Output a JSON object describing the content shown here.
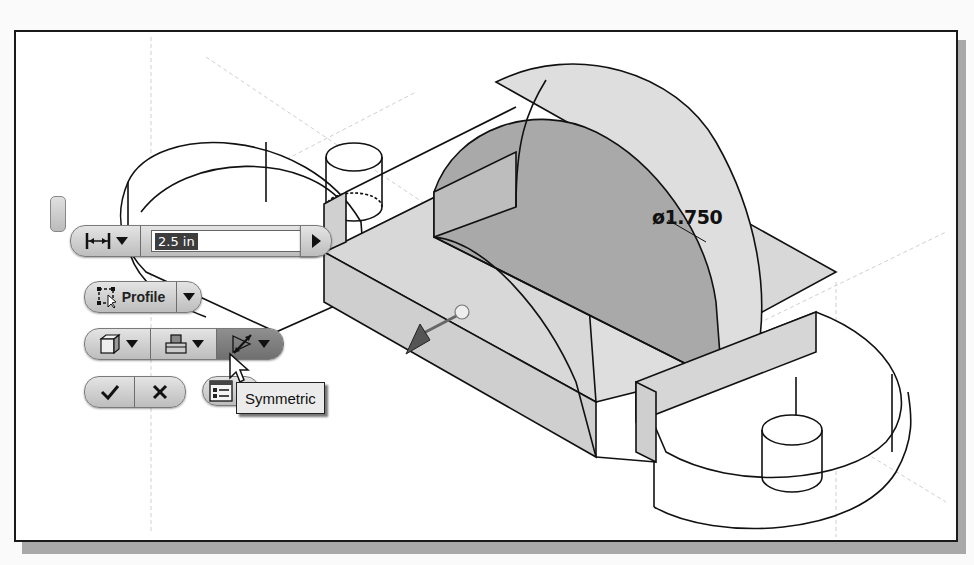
{
  "canvas": {
    "frame_color": "#1a1a1a",
    "shadow_color": "#a9a9a9",
    "model_fill_light": "#d6d6d6",
    "model_fill_dark": "#a7a7a7"
  },
  "model": {
    "dimension_label": "ø1.750",
    "icons": [
      "extrude-direction-arrow-icon",
      "drag-handle-sphere-icon"
    ]
  },
  "mini_toolbar": {
    "distance": {
      "mode_icon": "distance-icon",
      "value": "2.5 in",
      "accept_arrow_icon": "play-arrow-icon"
    },
    "profile": {
      "icon": "profile-select-icon",
      "label": "Profile"
    },
    "output_row": [
      {
        "icon": "solid-output-icon",
        "name": "output-solid"
      },
      {
        "icon": "boolean-operation-icon",
        "name": "boolean-join"
      },
      {
        "icon": "symmetric-direction-icon",
        "name": "direction-symmetric",
        "active": true
      }
    ],
    "ok_icon": "checkmark-icon",
    "cancel_icon": "close-icon",
    "options_icon": "options-list-icon"
  },
  "tooltip": {
    "text": "Symmetric"
  }
}
